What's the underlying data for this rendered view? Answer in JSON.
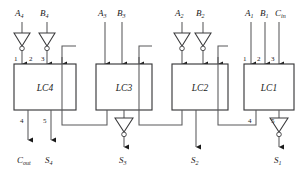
{
  "diagram": {
    "type": "logic-circuit-schematic",
    "blocks": [
      {
        "id": "lc4",
        "label": "LC4",
        "x": 14,
        "y": 64,
        "w": 62,
        "h": 46,
        "inputs": [
          {
            "pin": "1",
            "signal": "A4",
            "inverted": true
          },
          {
            "pin": "2",
            "signal": "B4",
            "inverted": true
          },
          {
            "pin": "3",
            "signal": "carry-from-LC3",
            "inverted": false
          },
          {
            "pin": "",
            "signal": "carry-in-bus",
            "inverted": false
          }
        ],
        "outputs": [
          {
            "pin": "4",
            "signal": "Cout"
          },
          {
            "pin": "5",
            "signal": "S4"
          }
        ]
      },
      {
        "id": "lc3",
        "label": "LC3",
        "x": 96,
        "y": 64,
        "w": 56,
        "h": 46,
        "inputs": [
          {
            "pin": "",
            "signal": "A3",
            "inverted": false
          },
          {
            "pin": "",
            "signal": "B3",
            "inverted": false
          },
          {
            "pin": "",
            "signal": "carry-from-LC2",
            "inverted": false
          }
        ],
        "outputs": [
          {
            "pin": "",
            "signal": "carry-to-LC4"
          },
          {
            "pin": "",
            "signal": "S3"
          }
        ]
      },
      {
        "id": "lc2",
        "label": "LC2",
        "x": 172,
        "y": 64,
        "w": 56,
        "h": 46,
        "inputs": [
          {
            "pin": "",
            "signal": "A2",
            "inverted": true
          },
          {
            "pin": "",
            "signal": "B2",
            "inverted": true
          },
          {
            "pin": "",
            "signal": "carry-from-LC1",
            "inverted": false
          }
        ],
        "outputs": [
          {
            "pin": "",
            "signal": "carry-to-LC3"
          },
          {
            "pin": "",
            "signal": "S2"
          }
        ]
      },
      {
        "id": "lc1",
        "label": "LC1",
        "x": 244,
        "y": 64,
        "w": 50,
        "h": 46,
        "inputs": [
          {
            "pin": "1",
            "signal": "A1",
            "inverted": false
          },
          {
            "pin": "2",
            "signal": "B1",
            "inverted": false
          },
          {
            "pin": "3",
            "signal": "Cin",
            "inverted": false
          }
        ],
        "outputs": [
          {
            "pin": "4",
            "signal": "carry-to-LC2"
          },
          {
            "pin": "5",
            "signal": "S1"
          }
        ]
      }
    ],
    "input_labels": [
      {
        "id": "a4",
        "base": "A",
        "sub": "4",
        "x": 15,
        "y": 14
      },
      {
        "id": "b4",
        "base": "B",
        "sub": "4",
        "x": 40,
        "y": 14
      },
      {
        "id": "a3",
        "base": "A",
        "sub": "3",
        "x": 98,
        "y": 14
      },
      {
        "id": "b3",
        "base": "B",
        "sub": "3",
        "x": 118,
        "y": 14
      },
      {
        "id": "a2",
        "base": "A",
        "sub": "2",
        "x": 175,
        "y": 14
      },
      {
        "id": "b2",
        "base": "B",
        "sub": "2",
        "x": 196,
        "y": 14
      },
      {
        "id": "a1",
        "base": "A",
        "sub": "1",
        "x": 245,
        "y": 14
      },
      {
        "id": "b1",
        "base": "B",
        "sub": "1",
        "x": 263,
        "y": 14
      },
      {
        "id": "cin",
        "base": "C",
        "sub": "in",
        "x": 280,
        "y": 14
      }
    ],
    "output_labels": [
      {
        "id": "cout",
        "base": "C",
        "sub": "out",
        "x": 14,
        "y": 162
      },
      {
        "id": "s4",
        "base": "S",
        "sub": "4",
        "x": 44,
        "y": 162
      },
      {
        "id": "s3",
        "base": "S",
        "sub": "3",
        "x": 118,
        "y": 162
      },
      {
        "id": "s2",
        "base": "S",
        "sub": "2",
        "x": 190,
        "y": 162
      },
      {
        "id": "s1",
        "base": "S",
        "sub": "1",
        "x": 272,
        "y": 162
      }
    ],
    "pin_numbers": [
      {
        "id": "lc4-p1",
        "text": "1",
        "x": 14,
        "y": 60
      },
      {
        "id": "lc4-p2",
        "text": "2",
        "x": 31,
        "y": 60
      },
      {
        "id": "lc4-p3",
        "text": "3",
        "x": 47,
        "y": 60
      },
      {
        "id": "lc4-p4",
        "text": "4",
        "x": 21,
        "y": 121
      },
      {
        "id": "lc4-p5",
        "text": "5",
        "x": 47,
        "y": 121
      },
      {
        "id": "lc1-p1",
        "text": "1",
        "x": 244,
        "y": 60
      },
      {
        "id": "lc1-p2",
        "text": "2",
        "x": 258,
        "y": 60
      },
      {
        "id": "lc1-p3",
        "text": "3",
        "x": 272,
        "y": 60
      },
      {
        "id": "lc1-p4",
        "text": "4",
        "x": 250,
        "y": 121
      },
      {
        "id": "lc1-p5",
        "text": "5",
        "x": 272,
        "y": 121
      }
    ],
    "inverters": [
      {
        "id": "inv-a4",
        "x": 22,
        "y": 33,
        "dir": "down"
      },
      {
        "id": "inv-b4",
        "x": 47,
        "y": 33,
        "dir": "down"
      },
      {
        "id": "inv-a2",
        "x": 182,
        "y": 33,
        "dir": "down"
      },
      {
        "id": "inv-b2",
        "x": 203,
        "y": 33,
        "dir": "down"
      },
      {
        "id": "inv-s3",
        "x": 124,
        "y": 118,
        "dir": "down"
      },
      {
        "id": "inv-s1",
        "x": 278,
        "y": 118,
        "dir": "down"
      }
    ],
    "colors": {
      "wire": "#58585a",
      "outline": "#3a3a3c",
      "text": "#1a1a1a",
      "bg": "#ffffff"
    }
  }
}
